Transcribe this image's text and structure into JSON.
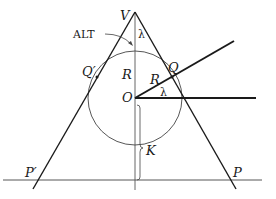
{
  "diagram": {
    "title": "",
    "colors": {
      "stroke": "#1a1a1a",
      "thin": "#444444",
      "background": "#ffffff"
    },
    "points": {
      "V": {
        "label": "V",
        "x": 135,
        "y": 13
      },
      "O": {
        "label": "O",
        "x": 135,
        "y": 98
      },
      "Q": {
        "label": "Q",
        "x": 172,
        "y": 77
      },
      "Q_prime": {
        "label": "Q′",
        "x": 97,
        "y": 77
      },
      "P": {
        "label": "P",
        "x": 231,
        "y": 180
      },
      "P_prime": {
        "label": "P′",
        "x": 38,
        "y": 180
      }
    },
    "labels": {
      "V": "V",
      "ALT": "ALT",
      "lambda_top": "λ",
      "lambda_center": "λ",
      "R_vertical": "R",
      "R_ray": "R",
      "O": "O",
      "Q": "Q",
      "Q_prime": "Q′",
      "K": "K",
      "P": "P",
      "P_prime": "P′"
    },
    "circle": {
      "cx": 135,
      "cy": 98,
      "r": 47
    },
    "ground_line": {
      "y": 180,
      "x1": 3,
      "x2": 262
    }
  }
}
